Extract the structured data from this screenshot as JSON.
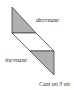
{
  "diagram": {
    "labels": {
      "decrease": "decrease",
      "increase": "increase",
      "cast_on": "Cast on 3 sts"
    },
    "colors": {
      "shade": "#b0b0b0",
      "stroke": "#444444"
    }
  }
}
